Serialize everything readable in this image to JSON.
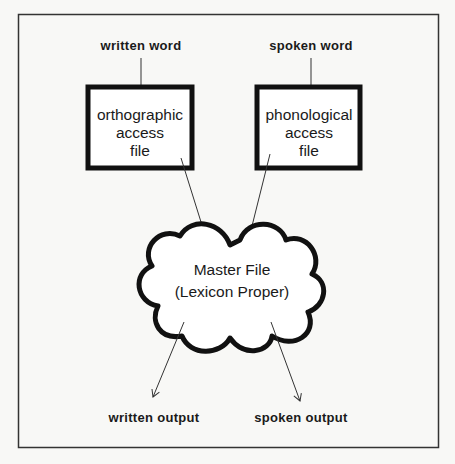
{
  "diagram": {
    "inputs": {
      "written": "written word",
      "spoken": "spoken word"
    },
    "boxes": {
      "orthographic": [
        "orthographic",
        "access",
        "file"
      ],
      "phonological": [
        "phonological",
        "access",
        "file"
      ]
    },
    "master": {
      "line1": "Master File",
      "line2": "(Lexicon Proper)"
    },
    "outputs": {
      "written": "written output",
      "spoken": "spoken output"
    },
    "colors": {
      "ink": "#1a1a1a",
      "background": "#f8f8f6"
    }
  }
}
